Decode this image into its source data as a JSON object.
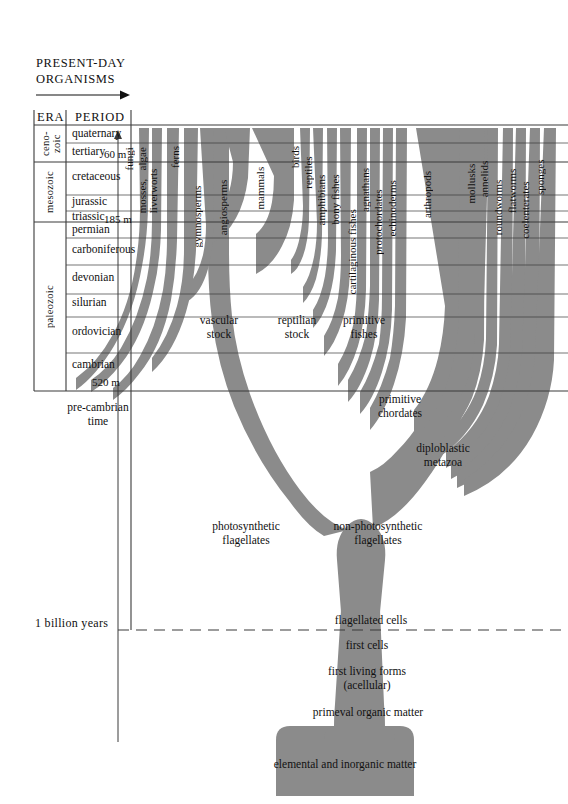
{
  "header": {
    "title_line1": "PRESENT-DAY",
    "title_line2": "ORGANISMS",
    "arrow_icon": "right-arrow-icon"
  },
  "table": {
    "era_header": "ERA",
    "period_header": "PERIOD"
  },
  "eras": [
    {
      "name": "ceno-\nzoic",
      "label": "ceno- zoic",
      "y_top": 125,
      "y_bottom": 162
    },
    {
      "name": "mesozoic",
      "label": "mesozoic",
      "y_top": 162,
      "y_bottom": 222
    },
    {
      "name": "paleozoic",
      "label": "paleozoic",
      "y_top": 222,
      "y_bottom": 391
    }
  ],
  "periods": [
    {
      "name": "quaternary",
      "age": "",
      "y_top": 125,
      "y_bottom": 143
    },
    {
      "name": "tertiary",
      "age": "60 m",
      "y_top": 143,
      "y_bottom": 162
    },
    {
      "name": "cretaceous",
      "age": "",
      "y_top": 162,
      "y_bottom": 195
    },
    {
      "name": "jurassic",
      "age": "",
      "y_top": 195,
      "y_bottom": 211
    },
    {
      "name": "triassic",
      "age": "185 m",
      "y_top": 211,
      "y_bottom": 222
    },
    {
      "name": "permian",
      "age": "",
      "y_top": 222,
      "y_bottom": 238
    },
    {
      "name": "carboniferous",
      "age": "",
      "y_top": 238,
      "y_bottom": 265
    },
    {
      "name": "devonian",
      "age": "",
      "y_top": 265,
      "y_bottom": 294
    },
    {
      "name": "silurian",
      "age": "",
      "y_top": 294,
      "y_bottom": 317
    },
    {
      "name": "ordovician",
      "age": "",
      "y_top": 317,
      "y_bottom": 353
    },
    {
      "name": "cambrian",
      "age": "520 m",
      "y_top": 353,
      "y_bottom": 391
    }
  ],
  "precambrian": {
    "line1": "pre-cambrian",
    "line2": "time"
  },
  "organisms": [
    {
      "label": "fungi",
      "x": 140
    },
    {
      "label": "algae",
      "x": 153
    },
    {
      "label": "mosses,\nliverworts",
      "x": 167
    },
    {
      "label": "ferns",
      "x": 184
    },
    {
      "label": "gymnosperms",
      "x": 207
    },
    {
      "label": "angiosperms",
      "x": 233
    },
    {
      "label": "mammals",
      "x": 270
    },
    {
      "label": "birds",
      "x": 305
    },
    {
      "label": "reptiles",
      "x": 318
    },
    {
      "label": "amphibians",
      "x": 331
    },
    {
      "label": "bony fishes",
      "x": 344
    },
    {
      "label": "cartilaginous fishes",
      "x": 362
    },
    {
      "label": "agnathans",
      "x": 375
    },
    {
      "label": "protochordates",
      "x": 388
    },
    {
      "label": "echinoderms",
      "x": 401
    },
    {
      "label": "arthropods",
      "x": 436
    },
    {
      "label": "mollusks",
      "x": 480
    },
    {
      "label": "annelids",
      "x": 493
    },
    {
      "label": "roundworms",
      "x": 508
    },
    {
      "label": "flatworms",
      "x": 521
    },
    {
      "label": "coelenterates",
      "x": 535
    },
    {
      "label": "sponges",
      "x": 549
    }
  ],
  "inner_labels": [
    {
      "text": "vascular\nstock",
      "line1": "vascular",
      "line2": "stock",
      "x": 218,
      "y": 315
    },
    {
      "text": "reptilian\nstock",
      "line1": "reptilian",
      "line2": "stock",
      "x": 297,
      "y": 315
    },
    {
      "text": "primitive\nfishes",
      "line1": "primitive",
      "line2": "fishes",
      "x": 364,
      "y": 315
    },
    {
      "text": "primitive\nchordates",
      "line1": "primitive",
      "line2": "chordates",
      "x": 400,
      "y": 397
    },
    {
      "text": "diploblastic\nmetazoa",
      "line1": "diploblastic",
      "line2": "metazoa",
      "x": 443,
      "y": 446
    },
    {
      "text": "photosynthetic\nflagellates",
      "line1": "photosynthetic",
      "line2": "flagellates",
      "x": 246,
      "y": 525
    },
    {
      "text": "non-photosynthetic\nflagellates",
      "line1": "non-photosynthetic",
      "line2": "flagellates",
      "x": 378,
      "y": 525
    },
    {
      "text": "flagellated cells",
      "line1": "flagellated cells",
      "line2": "",
      "x": 371,
      "y": 619
    },
    {
      "text": "first cells",
      "line1": "first cells",
      "line2": "",
      "x": 365,
      "y": 645
    },
    {
      "text": "first living forms\n(acellular)",
      "line1": "first living forms",
      "line2": "(acellular)",
      "x": 365,
      "y": 672
    },
    {
      "text": "primeval organic matter",
      "line1": "primeval organic matter",
      "line2": "",
      "x": 363,
      "y": 711
    },
    {
      "text": "elemental and inorganic matter",
      "line1": "elemental and inorganic matter",
      "line2": "",
      "x": 291,
      "y": 763
    }
  ],
  "timescale": {
    "billion_label": "1 billion years",
    "dashed_line_y": 630
  },
  "colors": {
    "tree_fill": "#8b8b8b",
    "rule": "#3a3a3a",
    "text": "#111111",
    "background": "#ffffff"
  }
}
